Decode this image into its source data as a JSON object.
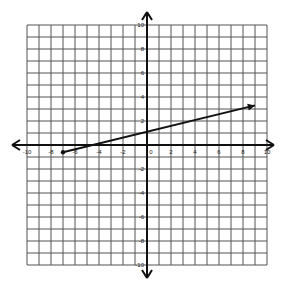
{
  "chart_data": {
    "type": "line",
    "title": "",
    "xlabel": "",
    "ylabel": "",
    "xlim": [
      -10,
      10
    ],
    "ylim": [
      -10,
      10
    ],
    "grid": true,
    "grid_step": 1,
    "x_ticks": [
      -10,
      -8,
      -6,
      -4,
      -2,
      0,
      2,
      4,
      6,
      8,
      10
    ],
    "y_ticks": [
      10,
      8,
      6,
      4,
      2,
      -2,
      -4,
      -6,
      -8,
      -10
    ],
    "series": [
      {
        "name": "line",
        "points": [
          [
            -7,
            -0.6
          ],
          [
            9,
            3.3
          ]
        ],
        "start_marker": "dot",
        "end_marker": "arrow"
      }
    ],
    "axes_arrows": true
  },
  "labels": {
    "x": [
      "-10",
      "-8",
      "-6",
      "-4",
      "-2",
      "0",
      "2",
      "4",
      "6",
      "8",
      "10"
    ],
    "y": [
      "10",
      "8",
      "6",
      "4",
      "2",
      "-2",
      "-4",
      "-6",
      "-8",
      "-10"
    ]
  }
}
